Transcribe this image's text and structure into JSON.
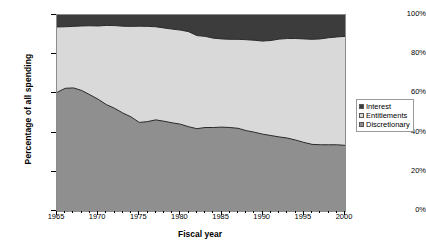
{
  "chart_data": {
    "type": "area",
    "stacked": true,
    "title": "",
    "xlabel": "Fiscal year",
    "ylabel": "Percentage of all spending",
    "xlim": [
      1965,
      2000
    ],
    "ylim": [
      0,
      100
    ],
    "grid": false,
    "legend_position": "right",
    "x_tick_labels": [
      "1965",
      "1970",
      "1975",
      "1980",
      "1985",
      "1990",
      "1995",
      "2000"
    ],
    "x_tick_values": [
      1965,
      1970,
      1975,
      1980,
      1985,
      1990,
      1995,
      2000
    ],
    "y_tick_labels": [
      "0%",
      "20%",
      "40%",
      "60%",
      "80%",
      "100%"
    ],
    "y_tick_values": [
      0,
      20,
      40,
      60,
      80,
      100
    ],
    "x": [
      1965,
      1966,
      1967,
      1968,
      1969,
      1970,
      1971,
      1972,
      1973,
      1974,
      1975,
      1976,
      1977,
      1978,
      1979,
      1980,
      1981,
      1982,
      1983,
      1984,
      1985,
      1986,
      1987,
      1988,
      1989,
      1990,
      1991,
      1992,
      1993,
      1994,
      1995,
      1996,
      1997,
      1998,
      1999,
      2000
    ],
    "series": [
      {
        "name": "Discretionary",
        "color": "#8f8f8f",
        "values": [
          60.5,
          62.6,
          62.8,
          61.5,
          59.3,
          57.0,
          54.3,
          52.4,
          50.0,
          48.0,
          45.2,
          45.6,
          46.5,
          45.8,
          45.0,
          44.3,
          43.0,
          42.0,
          42.6,
          42.6,
          42.8,
          42.6,
          42.2,
          41.0,
          40.2,
          39.2,
          38.5,
          37.8,
          37.2,
          36.2,
          35.0,
          34.0,
          33.8,
          33.8,
          33.8,
          33.5
        ]
      },
      {
        "name": "Entitlements",
        "color": "#d9d9d9",
        "values": [
          33.4,
          31.4,
          31.4,
          32.9,
          35.2,
          37.4,
          40.4,
          42.2,
          44.3,
          46.2,
          49.1,
          48.6,
          47.5,
          47.6,
          47.8,
          48.0,
          48.5,
          47.5,
          46.5,
          45.6,
          45.0,
          45.0,
          45.4,
          46.4,
          46.9,
          47.5,
          48.5,
          49.9,
          50.8,
          51.8,
          52.8,
          53.6,
          54.0,
          54.6,
          55.0,
          55.6
        ]
      },
      {
        "name": "Interest",
        "color": "#3c3c3c",
        "values": [
          6.1,
          6.0,
          5.8,
          5.6,
          5.5,
          5.6,
          5.3,
          5.4,
          5.7,
          5.8,
          5.7,
          5.8,
          6.0,
          6.6,
          7.2,
          7.7,
          8.5,
          10.5,
          10.9,
          11.8,
          12.2,
          12.4,
          12.4,
          12.6,
          12.9,
          13.3,
          13.0,
          12.3,
          12.0,
          12.0,
          12.2,
          12.4,
          12.2,
          11.6,
          11.2,
          10.9
        ]
      }
    ],
    "cumulative_upper_boundaries": {
      "discretionary_top": [
        60.5,
        62.6,
        62.8,
        61.5,
        59.3,
        57.0,
        54.3,
        52.4,
        50.0,
        48.0,
        45.2,
        45.6,
        46.5,
        45.8,
        45.0,
        44.3,
        43.0,
        42.0,
        42.6,
        42.6,
        42.8,
        42.6,
        42.2,
        41.0,
        40.2,
        39.2,
        38.5,
        37.8,
        37.2,
        36.2,
        35.0,
        34.0,
        33.8,
        33.8,
        33.8,
        33.5
      ],
      "entitlements_top": [
        93.9,
        94.0,
        94.2,
        94.4,
        94.5,
        94.4,
        94.7,
        94.6,
        94.3,
        94.2,
        94.3,
        94.2,
        94.0,
        93.4,
        92.8,
        92.3,
        91.5,
        89.5,
        89.1,
        88.2,
        87.8,
        87.6,
        87.6,
        87.4,
        87.1,
        86.7,
        87.0,
        87.7,
        88.0,
        88.0,
        87.8,
        87.6,
        87.8,
        88.4,
        88.8,
        89.1
      ]
    }
  },
  "legend": {
    "entries": [
      {
        "label": "Interest",
        "color": "#3c3c3c"
      },
      {
        "label": "Entitlements",
        "color": "#d9d9d9"
      },
      {
        "label": "Discretionary",
        "color": "#8f8f8f"
      }
    ]
  },
  "axes": {
    "y_title": "Percentage of all spending",
    "x_title": "Fiscal year",
    "y_ticks": [
      "100%",
      "80%",
      "60%",
      "40%",
      "20%",
      "0%"
    ],
    "x_ticks": [
      "1965",
      "1970",
      "1975",
      "1980",
      "1985",
      "1990",
      "1995",
      "2000"
    ]
  },
  "colors": {
    "interest": "#3c3c3c",
    "entitlements": "#d9d9d9",
    "discretionary": "#8f8f8f",
    "frame": "#8c8c8c",
    "boundary_line": "#2a2a2a",
    "background": "#ffffff"
  }
}
